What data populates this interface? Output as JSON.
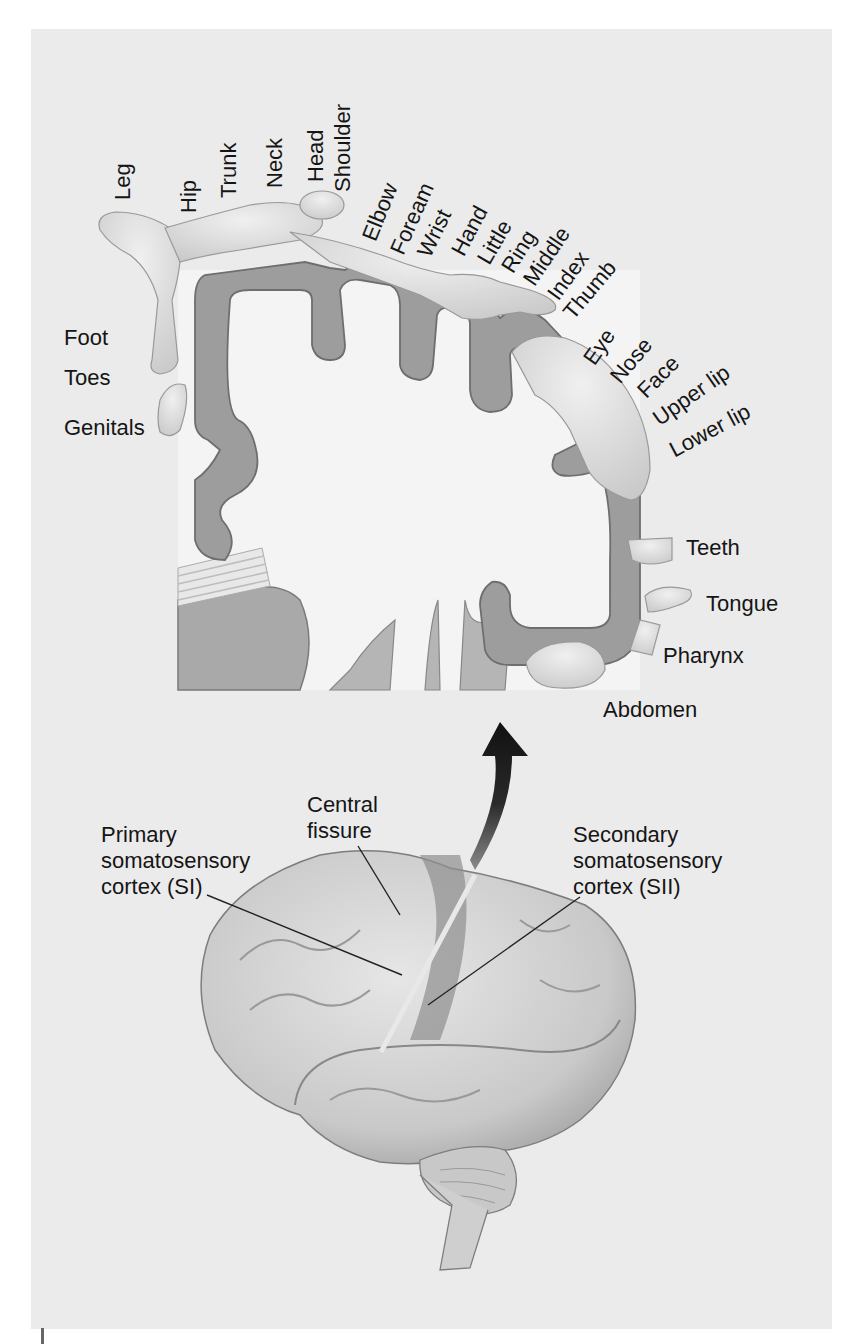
{
  "figure": {
    "colors": {
      "panel_background": "#ebebeb",
      "cortex_gray_matter": "#9a9a9a",
      "white_matter": "#f2f2f2",
      "body_figure": "#dcdcdc",
      "arrow": "#1a1a1a",
      "label_text": "#151515"
    }
  },
  "homunculus": {
    "labels_top": [
      {
        "id": "leg",
        "text": "Leg"
      },
      {
        "id": "hip",
        "text": "Hip"
      },
      {
        "id": "trunk",
        "text": "Trunk"
      },
      {
        "id": "neck",
        "text": "Neck"
      },
      {
        "id": "head",
        "text": "Head"
      },
      {
        "id": "shoulder",
        "text": "Shoulder"
      }
    ],
    "labels_arm": [
      {
        "id": "elbow",
        "text": "Elbow"
      },
      {
        "id": "forearm",
        "text": "Foream"
      },
      {
        "id": "wrist",
        "text": "Wrist"
      },
      {
        "id": "hand",
        "text": "Hand"
      },
      {
        "id": "little",
        "text": "Little"
      },
      {
        "id": "ring",
        "text": "Ring"
      },
      {
        "id": "middle",
        "text": "Middle"
      },
      {
        "id": "index",
        "text": "Index"
      },
      {
        "id": "thumb",
        "text": "Thumb"
      }
    ],
    "labels_face": [
      {
        "id": "eye",
        "text": "Eye"
      },
      {
        "id": "nose",
        "text": "Nose"
      },
      {
        "id": "face",
        "text": "Face"
      },
      {
        "id": "upper-lip",
        "text": "Upper lip"
      },
      {
        "id": "lower-lip",
        "text": "Lower lip"
      }
    ],
    "labels_left": [
      {
        "id": "foot",
        "text": "Foot"
      },
      {
        "id": "toes",
        "text": "Toes"
      },
      {
        "id": "genitals",
        "text": "Genitals"
      }
    ],
    "labels_right": [
      {
        "id": "teeth",
        "text": "Teeth"
      },
      {
        "id": "tongue",
        "text": "Tongue"
      },
      {
        "id": "pharynx",
        "text": "Pharynx"
      },
      {
        "id": "abdomen",
        "text": "Abdomen"
      }
    ]
  },
  "brain": {
    "primary": {
      "line1": "Primary",
      "line2": "somatosensory",
      "line3": "cortex (SI)"
    },
    "central": {
      "line1": "Central",
      "line2": "fissure"
    },
    "secondary": {
      "line1": "Secondary",
      "line2": "somatosensory",
      "line3": "cortex (SII)"
    }
  }
}
